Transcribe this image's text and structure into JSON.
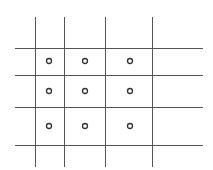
{
  "diagram": {
    "type": "grid-with-points",
    "background": "#ffffff",
    "line_color": "#555555",
    "circle_color": "#333333",
    "vertical_lines_x": [
      35,
      64,
      105,
      152
    ],
    "horizontal_lines_y": [
      48,
      75,
      107,
      145
    ],
    "vertical_extent": [
      17,
      167
    ],
    "horizontal_extent": [
      15,
      203
    ],
    "points": [
      {
        "x": 49,
        "y": 61
      },
      {
        "x": 85,
        "y": 61
      },
      {
        "x": 130,
        "y": 61
      },
      {
        "x": 49,
        "y": 91
      },
      {
        "x": 85,
        "y": 91
      },
      {
        "x": 130,
        "y": 91
      },
      {
        "x": 49,
        "y": 126
      },
      {
        "x": 85,
        "y": 126
      },
      {
        "x": 130,
        "y": 126
      }
    ],
    "point_radius": 2.5
  }
}
